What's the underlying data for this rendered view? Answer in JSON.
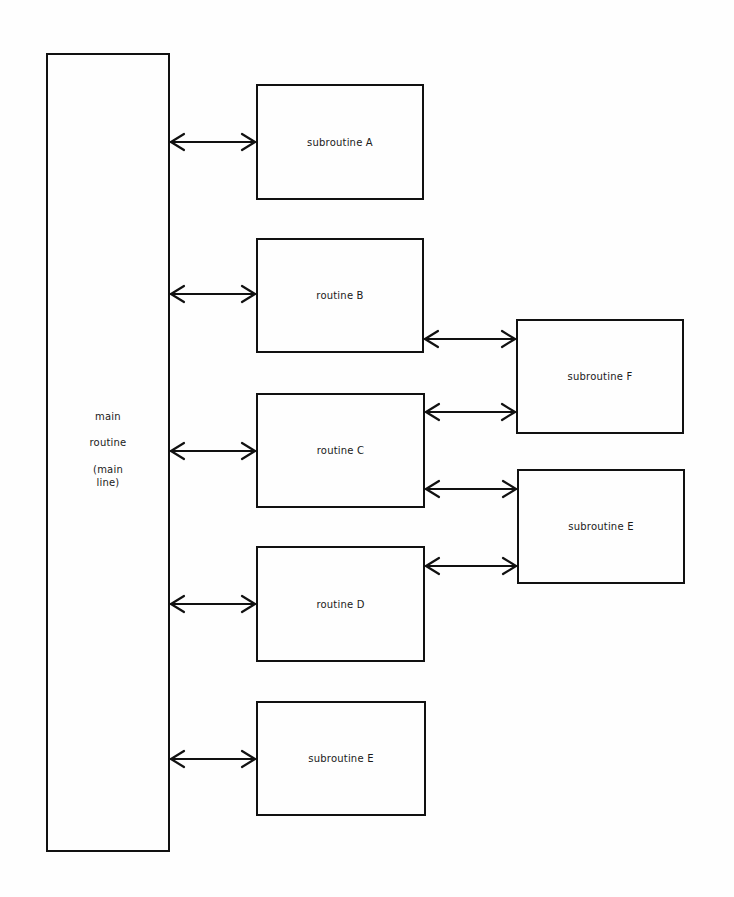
{
  "diagram": {
    "main": {
      "lines": [
        "main",
        "routine",
        "(main",
        "line)"
      ],
      "box": {
        "x": 46,
        "y": 53,
        "w": 124,
        "h": 799
      }
    },
    "boxes": [
      {
        "id": "subroutine-a",
        "label": "subroutine A",
        "x": 256,
        "y": 84,
        "w": 168,
        "h": 116
      },
      {
        "id": "routine-b",
        "label": "routine B",
        "x": 256,
        "y": 238,
        "w": 168,
        "h": 115
      },
      {
        "id": "routine-c",
        "label": "routine C",
        "x": 256,
        "y": 393,
        "w": 169,
        "h": 115
      },
      {
        "id": "routine-d",
        "label": "routine D",
        "x": 256,
        "y": 546,
        "w": 169,
        "h": 116
      },
      {
        "id": "subroutine-e-bottom",
        "label": "subroutine E",
        "x": 256,
        "y": 701,
        "w": 170,
        "h": 115
      },
      {
        "id": "subroutine-f",
        "label": "subroutine F",
        "x": 516,
        "y": 319,
        "w": 168,
        "h": 115
      },
      {
        "id": "subroutine-e-right",
        "label": "subroutine E",
        "x": 517,
        "y": 469,
        "w": 168,
        "h": 115
      }
    ],
    "connections": [
      {
        "from": "main",
        "to": "subroutine-a",
        "x1": 170,
        "x2": 256,
        "y": 142,
        "type": "bidirectional"
      },
      {
        "from": "main",
        "to": "routine-b",
        "x1": 170,
        "x2": 256,
        "y": 294,
        "type": "bidirectional"
      },
      {
        "from": "main",
        "to": "routine-c",
        "x1": 170,
        "x2": 256,
        "y": 451,
        "type": "bidirectional"
      },
      {
        "from": "main",
        "to": "routine-d",
        "x1": 170,
        "x2": 256,
        "y": 604,
        "type": "bidirectional"
      },
      {
        "from": "main",
        "to": "subroutine-e-bottom",
        "x1": 170,
        "x2": 256,
        "y": 759,
        "type": "bidirectional"
      },
      {
        "from": "routine-b",
        "to": "subroutine-f",
        "x1": 424,
        "x2": 516,
        "y": 339,
        "type": "bidirectional"
      },
      {
        "from": "routine-c",
        "to": "subroutine-f",
        "x1": 425,
        "x2": 516,
        "y": 412,
        "type": "bidirectional"
      },
      {
        "from": "routine-c",
        "to": "subroutine-e-right",
        "x1": 425,
        "x2": 517,
        "y": 489,
        "type": "bidirectional"
      },
      {
        "from": "routine-d",
        "to": "subroutine-e-right",
        "x1": 425,
        "x2": 517,
        "y": 566,
        "type": "bidirectional"
      }
    ],
    "colors": {
      "stroke": "#111111",
      "background": "#fefefe",
      "text": "#1a1a1a"
    }
  }
}
